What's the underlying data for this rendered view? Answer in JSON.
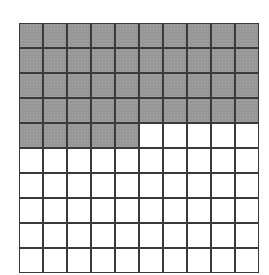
{
  "figure": {
    "type": "hundred-grid",
    "rows": 10,
    "columns": 10,
    "total_cells": 100,
    "shaded_cells": 45,
    "full_shaded_rows": 4,
    "partial_row_shaded": 5,
    "fill_order": "row-major, left to right, top to bottom",
    "colors": {
      "shaded": "#9a9a9a",
      "unshaded": "#ffffff",
      "grid_line": "#3a3a3a"
    }
  }
}
